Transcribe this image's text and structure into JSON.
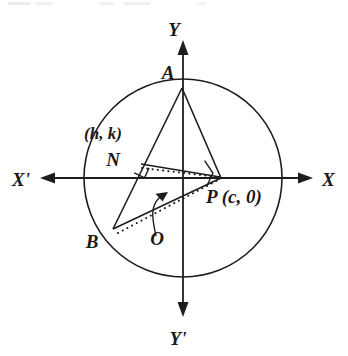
{
  "figure": {
    "type": "geometry-diagram",
    "background_color": "#ffffff",
    "ink_color": "#1d1d1d"
  },
  "axes": {
    "x_positive_label": "X",
    "x_negative_label": "X'",
    "y_positive_label": "Y",
    "y_negative_label": "Y'",
    "origin_label": "O",
    "origin": {
      "x": 183,
      "y": 178
    }
  },
  "circle": {
    "center_x": 183,
    "center_y": 178,
    "radius": 99
  },
  "points": [
    {
      "id": "A",
      "label": "A",
      "x": 182,
      "y": 88,
      "label_x": 168,
      "label_y": 79,
      "on_circle": true
    },
    {
      "id": "B",
      "label": "B",
      "x": 113,
      "y": 229,
      "label_x": 92,
      "label_y": 248,
      "on_circle": true
    },
    {
      "id": "P",
      "label": "P (c, 0)",
      "x": 221,
      "y": 178,
      "label_x": 206,
      "label_y": 203,
      "on_circle": false
    },
    {
      "id": "N",
      "label": "N",
      "x": 138,
      "y": 165,
      "label_x": 113,
      "label_y": 166,
      "on_circle": false
    }
  ],
  "annotations": {
    "midpoint_coords": "(h, k)",
    "midpoint_coords_x": 103,
    "midpoint_coords_y": 139,
    "origin_marker": "O",
    "origin_marker_x": 157,
    "origin_marker_y": 245
  },
  "segments": [
    {
      "name": "A-B",
      "style": "solid"
    },
    {
      "name": "A-P",
      "style": "solid"
    },
    {
      "name": "B-P",
      "style": "solid"
    },
    {
      "name": "N-P",
      "style": "dotted"
    },
    {
      "name": "B-P-inner",
      "style": "dotted"
    }
  ],
  "right_angles": [
    {
      "name": "right-angle-at-N",
      "at": "N"
    },
    {
      "name": "right-angle-at-P",
      "at": "P"
    }
  ]
}
